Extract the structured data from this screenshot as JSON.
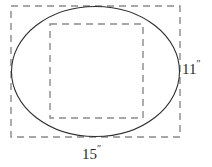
{
  "figure": {
    "type": "geometry-diagram",
    "background_color": "#ffffff",
    "stroke_colors": {
      "ellipse": "#2f2f2f",
      "dashed_guide": "#8a8a8a",
      "label_text": "#2b2b2b"
    },
    "shapes": {
      "bounding_rectangle": {
        "name": "outer-dashed-rectangle",
        "style": "dashed",
        "x": 11,
        "y": 6,
        "width": 169,
        "height": 131
      },
      "ellipse": {
        "name": "inscribed-ellipse",
        "style": "solid",
        "cx": 95.5,
        "cy": 71.5,
        "rx": 84.5,
        "ry": 65.5
      },
      "inner_square": {
        "name": "inner-dashed-square",
        "style": "dashed",
        "x": 50,
        "y": 24,
        "width": 93,
        "height": 94
      }
    },
    "dimensions": {
      "height_label": "11",
      "height_unit": "″",
      "width_label": "15",
      "width_unit": "″"
    }
  }
}
